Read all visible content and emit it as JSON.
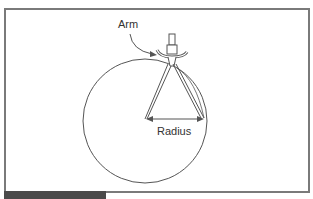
{
  "diagram": {
    "type": "compass-drawing-circle",
    "labels": {
      "arm": "Arm",
      "radius": "Radius"
    },
    "colors": {
      "frame_border": "#7a7a7a",
      "line": "#555555",
      "caption_bar": "#4a4a4a",
      "background": "#ffffff"
    }
  }
}
